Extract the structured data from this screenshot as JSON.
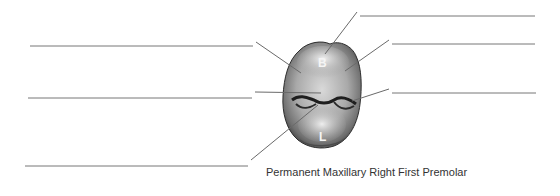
{
  "diagram": {
    "caption": "Permanent Maxillary Right First Premolar",
    "tooth_labels": {
      "buccal": "B",
      "lingual": "L"
    },
    "answer_blanks": {
      "left": [
        "",
        "",
        ""
      ],
      "right": [
        "",
        "",
        ""
      ]
    },
    "colors": {
      "line": "#777777",
      "tooth_light": "#e6e6e6",
      "tooth_mid": "#a8a8a8",
      "tooth_dark": "#3a3a3a"
    }
  }
}
